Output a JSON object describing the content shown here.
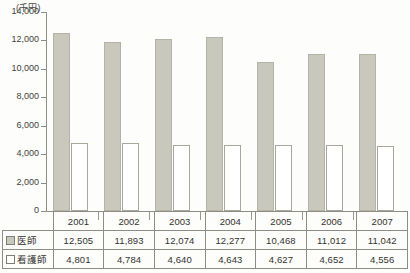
{
  "chart_data": {
    "type": "bar",
    "title": "",
    "subtitle": "",
    "xlabel": "",
    "ylabel": "",
    "unit_label": "(千円)",
    "categories": [
      "2001",
      "2002",
      "2003",
      "2004",
      "2005",
      "2006",
      "2007"
    ],
    "series": [
      {
        "name": "医師",
        "swatch": "gray-filled",
        "color": "#c9c8bd",
        "values": [
          12505,
          11893,
          12074,
          12277,
          10468,
          11012,
          11042
        ],
        "labels": [
          "12,505",
          "11,893",
          "12,074",
          "12,277",
          "10,468",
          "11,012",
          "11,042"
        ]
      },
      {
        "name": "看護師",
        "swatch": "white-outlined",
        "color": "#ffffff",
        "values": [
          4801,
          4784,
          4640,
          4643,
          4627,
          4652,
          4556
        ],
        "labels": [
          "4,801",
          "4,784",
          "4,640",
          "4,643",
          "4,627",
          "4,652",
          "4,556"
        ]
      }
    ],
    "ylim": [
      0,
      14000
    ],
    "ystep": 2000,
    "yticks": [
      0,
      2000,
      4000,
      6000,
      8000,
      10000,
      12000,
      14000
    ],
    "ytick_labels": [
      "0",
      "2,000",
      "4,000",
      "6,000",
      "8,000",
      "10,000",
      "12,000",
      "14,000"
    ],
    "grid": false,
    "legend_position": "table-first-column"
  },
  "table": {
    "header_row": [
      "",
      "2001",
      "2002",
      "2003",
      "2004",
      "2005",
      "2006",
      "2007"
    ],
    "rows": [
      {
        "label": "医師",
        "swatch": "gray",
        "cells": [
          "12,505",
          "11,893",
          "12,074",
          "12,277",
          "10,468",
          "11,012",
          "11,042"
        ]
      },
      {
        "label": "看護師",
        "swatch": "white",
        "cells": [
          "4,801",
          "4,784",
          "4,640",
          "4,643",
          "4,627",
          "4,652",
          "4,556"
        ]
      }
    ]
  },
  "colors": {
    "series_doctor": "#c9c8bd",
    "series_nurse": "#ffffff",
    "axis": "#8e8e86",
    "text": "#33332f",
    "background": "#fdfdfb"
  }
}
